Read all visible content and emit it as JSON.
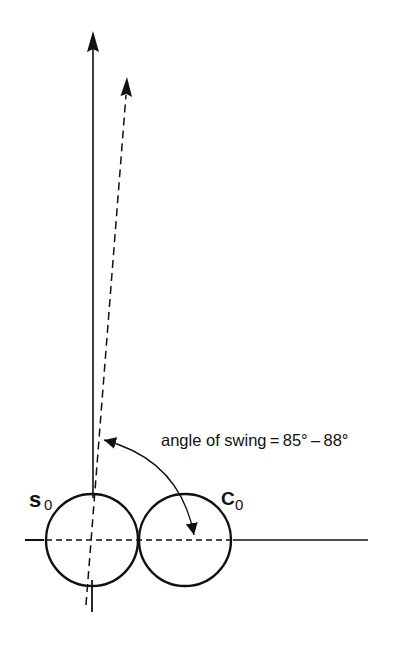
{
  "diagram": {
    "title": "",
    "colors": {
      "ink": "#111111",
      "background": "#ffffff"
    },
    "labels": {
      "angle": "angle of swing = 85° – 88°",
      "left_circle_main": "s",
      "left_circle_sub": "0",
      "right_circle_main": "C",
      "right_circle_sub": "0"
    },
    "elements": {
      "vertical_axis": "solid vertical arrow",
      "swung_axis": "dashed arrow tilted slightly right",
      "horizontal_axis": "horizontal reference line",
      "circle_s0": "circle S0",
      "circle_c0": "circle C0",
      "swing_arc": "double-headed curved arrow indicating angle of swing"
    }
  }
}
